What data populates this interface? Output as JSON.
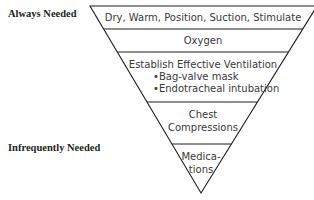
{
  "labels": {
    "top": "Always Needed",
    "bottom": "Infrequently Needed"
  },
  "pyramid": {
    "tiers": [
      {
        "id": "initial-steps",
        "lines": [
          "Dry, Warm, Position, Suction, Stimulate"
        ]
      },
      {
        "id": "oxygen",
        "lines": [
          "Oxygen"
        ]
      },
      {
        "id": "ventilation",
        "lines": [
          "Establish Effective Ventilation",
          "•Bag-valve mask",
          "•Endotracheal intubation"
        ]
      },
      {
        "id": "chest-compressions",
        "lines": [
          "Chest",
          "Compressions"
        ]
      },
      {
        "id": "medications",
        "lines": [
          "Medica-",
          "tions"
        ]
      }
    ]
  },
  "colors": {
    "line": "#231f20",
    "text": "#3a3a3a"
  }
}
